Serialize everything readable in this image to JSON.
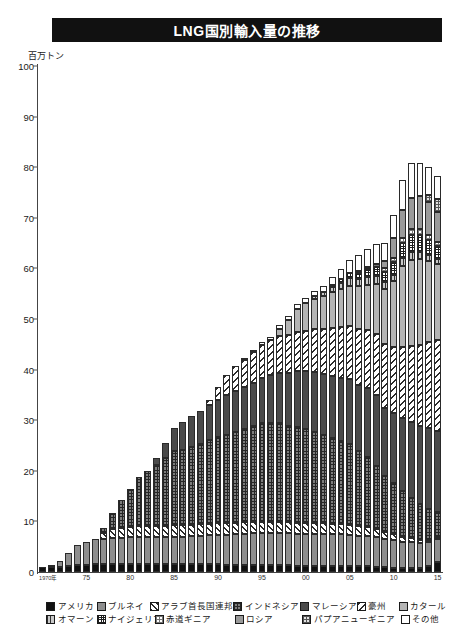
{
  "header": {
    "title": "LNG国別輸入量の推移"
  },
  "axis": {
    "unit_label": "百万トン",
    "y_ticks": [
      "100",
      "90",
      "80",
      "70",
      "60",
      "50",
      "40",
      "30",
      "20",
      "10",
      "0"
    ],
    "x_ticks": [
      "1970年",
      "75",
      "80",
      "85",
      "90",
      "95",
      "00",
      "05",
      "10",
      "15"
    ]
  },
  "legend": {
    "rows": [
      [
        {
          "label": "アメリカ",
          "pattern": "p-america",
          "key": "america"
        },
        {
          "label": "ブルネイ",
          "pattern": "p-brunei",
          "key": "brunei"
        },
        {
          "label": "アラブ首長国連邦",
          "pattern": "p-uae",
          "key": "uae"
        },
        {
          "label": "インドネシア",
          "pattern": "p-indonesia",
          "key": "indonesia"
        },
        {
          "label": "マレーシア",
          "pattern": "p-malaysia",
          "key": "malaysia"
        },
        {
          "label": "豪州",
          "pattern": "p-australia",
          "key": "australia"
        },
        {
          "label": "カタール",
          "pattern": "p-qatar",
          "key": "qatar"
        }
      ],
      [
        {
          "label": "オマーン",
          "pattern": "p-oman",
          "key": "oman"
        },
        {
          "label": "ナイジェリア",
          "pattern": "p-nigeria",
          "key": "nigeria"
        },
        {
          "label": "赤道ギニア",
          "pattern": "p-eqguinea",
          "key": "eqguinea"
        },
        {
          "label": "ロシア",
          "pattern": "p-russia",
          "key": "russia"
        },
        {
          "label": "パプアニューギニア",
          "pattern": "p-png",
          "key": "png"
        },
        {
          "label": "その他",
          "pattern": "p-other",
          "key": "other"
        }
      ]
    ]
  },
  "chart_data": {
    "type": "bar",
    "stacked": true,
    "title": "LNG国別輸入量の推移",
    "xlabel": "",
    "ylabel": "百万トン",
    "ylim": [
      0,
      100
    ],
    "ytick_step": 10,
    "grid": false,
    "legend_position": "bottom",
    "categories": [
      "1970",
      "1971",
      "1972",
      "1973",
      "1974",
      "1975",
      "1976",
      "1977",
      "1978",
      "1979",
      "1980",
      "1981",
      "1982",
      "1983",
      "1984",
      "1985",
      "1986",
      "1987",
      "1988",
      "1989",
      "1990",
      "1991",
      "1992",
      "1993",
      "1994",
      "1995",
      "1996",
      "1997",
      "1998",
      "1999",
      "2000",
      "2001",
      "2002",
      "2003",
      "2004",
      "2005",
      "2006",
      "2007",
      "2008",
      "2009",
      "2010",
      "2011",
      "2012",
      "2013",
      "2014",
      "2015"
    ],
    "series": [
      {
        "name": "アメリカ",
        "pattern": "p-america",
        "values": [
          1.0,
          1.0,
          1.0,
          1.2,
          1.3,
          1.4,
          1.5,
          1.5,
          1.5,
          1.5,
          1.6,
          1.5,
          1.5,
          1.5,
          1.5,
          1.5,
          1.5,
          1.5,
          1.5,
          1.5,
          1.5,
          1.4,
          1.4,
          1.4,
          1.4,
          1.3,
          1.3,
          1.3,
          1.3,
          1.2,
          1.2,
          1.2,
          1.2,
          1.2,
          1.2,
          1.2,
          1.1,
          1.1,
          1.0,
          0.9,
          0.8,
          0.7,
          0.7,
          0.8,
          1.1,
          2.0
        ]
      },
      {
        "name": "ブルネイ",
        "pattern": "p-brunei",
        "values": [
          0.0,
          0.3,
          1.2,
          2.6,
          4.0,
          4.6,
          5.0,
          5.1,
          5.2,
          5.3,
          5.3,
          5.4,
          5.4,
          5.4,
          5.4,
          5.5,
          5.5,
          5.6,
          5.7,
          5.8,
          5.9,
          6.0,
          6.1,
          6.2,
          6.3,
          6.4,
          6.4,
          6.4,
          6.4,
          6.4,
          6.4,
          6.4,
          6.4,
          6.3,
          6.3,
          6.2,
          6.1,
          6.0,
          5.9,
          5.7,
          5.5,
          5.3,
          5.2,
          5.0,
          4.8,
          4.5
        ]
      },
      {
        "name": "アラブ首長国連邦",
        "pattern": "p-uae",
        "values": [
          0,
          0,
          0,
          0,
          0,
          0,
          0,
          1.2,
          1.8,
          1.9,
          2.0,
          2.1,
          2.1,
          2.2,
          2.2,
          2.2,
          2.2,
          2.2,
          2.2,
          2.2,
          2.2,
          2.2,
          2.2,
          2.2,
          2.2,
          2.2,
          2.2,
          2.2,
          2.2,
          2.1,
          2.1,
          2.1,
          2.0,
          2.0,
          1.9,
          1.9,
          1.8,
          1.7,
          1.6,
          1.4,
          1.2,
          1.0,
          0.8,
          0.6,
          0.5,
          0.4
        ]
      },
      {
        "name": "インドネシア",
        "pattern": "p-indonesia",
        "values": [
          0,
          0,
          0,
          0,
          0,
          0,
          0,
          1.0,
          3.2,
          5.5,
          7.5,
          9.8,
          11.0,
          12.0,
          13.5,
          14.8,
          15.0,
          15.5,
          16.0,
          16.5,
          17.0,
          17.5,
          18.0,
          18.5,
          19.0,
          19.5,
          19.5,
          19.5,
          19.0,
          19.0,
          18.5,
          18.0,
          17.5,
          17.0,
          16.5,
          16.0,
          15.0,
          14.0,
          12.5,
          11.0,
          10.0,
          9.0,
          8.0,
          7.0,
          6.0,
          5.0
        ]
      },
      {
        "name": "マレーシア",
        "pattern": "p-malaysia",
        "values": [
          0,
          0,
          0,
          0,
          0,
          0,
          0,
          0,
          0,
          0,
          0,
          0,
          0,
          1.5,
          3.0,
          4.5,
          5.5,
          6.0,
          6.5,
          7.0,
          7.5,
          7.8,
          8.0,
          8.2,
          8.5,
          9.0,
          9.5,
          10.0,
          10.5,
          11.0,
          11.5,
          11.8,
          12.0,
          12.3,
          12.5,
          12.8,
          13.0,
          13.5,
          14.0,
          13.5,
          14.0,
          14.5,
          15.0,
          15.5,
          16.0,
          16.0
        ]
      },
      {
        "name": "豪州",
        "pattern": "p-australia",
        "values": [
          0,
          0,
          0,
          0,
          0,
          0,
          0,
          0,
          0,
          0,
          0,
          0,
          0,
          0,
          0,
          0,
          0,
          0,
          0,
          1.0,
          2.5,
          4.0,
          5.0,
          5.5,
          6.0,
          6.5,
          7.0,
          7.2,
          7.5,
          7.8,
          8.0,
          8.5,
          9.0,
          9.5,
          10.0,
          10.5,
          11.0,
          11.5,
          12.0,
          12.5,
          13.0,
          14.0,
          15.0,
          16.0,
          17.0,
          18.0
        ]
      },
      {
        "name": "カタール",
        "pattern": "p-qatar",
        "values": [
          0,
          0,
          0,
          0,
          0,
          0,
          0,
          0,
          0,
          0,
          0,
          0,
          0,
          0,
          0,
          0,
          0,
          0,
          0,
          0,
          0,
          0,
          0,
          0,
          0,
          0,
          0,
          1.5,
          3.0,
          4.5,
          5.5,
          6.0,
          6.5,
          7.0,
          7.5,
          8.0,
          8.5,
          9.0,
          10.0,
          11.0,
          13.0,
          16.0,
          17.0,
          17.0,
          16.0,
          15.0
        ]
      },
      {
        "name": "オマーン",
        "pattern": "p-oman",
        "values": [
          0,
          0,
          0,
          0,
          0,
          0,
          0,
          0,
          0,
          0,
          0,
          0,
          0,
          0,
          0,
          0,
          0,
          0,
          0,
          0,
          0,
          0,
          0,
          0,
          0,
          0,
          0,
          0,
          0,
          0,
          0,
          0.5,
          0.8,
          1.0,
          1.2,
          1.5,
          1.5,
          1.5,
          1.5,
          1.3,
          1.2,
          1.5,
          1.5,
          1.3,
          1.2,
          1.0
        ]
      },
      {
        "name": "ナイジェリア",
        "pattern": "p-nigeria",
        "values": [
          0,
          0,
          0,
          0,
          0,
          0,
          0,
          0,
          0,
          0,
          0,
          0,
          0,
          0,
          0,
          0,
          0,
          0,
          0,
          0,
          0,
          0,
          0,
          0,
          0,
          0,
          0,
          0,
          0,
          0,
          0,
          0,
          0,
          0.5,
          0.8,
          1.0,
          1.2,
          1.5,
          1.8,
          2.0,
          2.5,
          3.0,
          3.5,
          3.5,
          3.0,
          2.5
        ]
      },
      {
        "name": "赤道ギニア",
        "pattern": "p-eqguinea",
        "values": [
          0,
          0,
          0,
          0,
          0,
          0,
          0,
          0,
          0,
          0,
          0,
          0,
          0,
          0,
          0,
          0,
          0,
          0,
          0,
          0,
          0,
          0,
          0,
          0,
          0,
          0,
          0,
          0,
          0,
          0,
          0,
          0,
          0,
          0,
          0,
          0,
          0.3,
          0.5,
          0.6,
          0.7,
          0.8,
          1.0,
          1.2,
          1.2,
          1.0,
          0.8
        ]
      },
      {
        "name": "ロシア",
        "pattern": "p-russia",
        "values": [
          0,
          0,
          0,
          0,
          0,
          0,
          0,
          0,
          0,
          0,
          0,
          0,
          0,
          0,
          0,
          0,
          0,
          0,
          0,
          0,
          0,
          0,
          0,
          0,
          0,
          0,
          0,
          0,
          0,
          0,
          0,
          0,
          0,
          0,
          0,
          0,
          0,
          0,
          0,
          1.5,
          4.0,
          5.5,
          6.0,
          6.5,
          6.5,
          6.0
        ]
      },
      {
        "name": "パプアニューギニア",
        "pattern": "p-png",
        "values": [
          0,
          0,
          0,
          0,
          0,
          0,
          0,
          0,
          0,
          0,
          0,
          0,
          0,
          0,
          0,
          0,
          0,
          0,
          0,
          0,
          0,
          0,
          0,
          0,
          0,
          0,
          0,
          0,
          0,
          0,
          0,
          0,
          0,
          0,
          0,
          0,
          0,
          0,
          0,
          0,
          0,
          0,
          0,
          0,
          1.5,
          2.5
        ]
      },
      {
        "name": "その他",
        "pattern": "p-other",
        "values": [
          0,
          0,
          0,
          0,
          0,
          0,
          0,
          0,
          0,
          0,
          0,
          0,
          0,
          0,
          0,
          0,
          0,
          0,
          0,
          0,
          0,
          0,
          0,
          0.3,
          0.4,
          0.5,
          0.6,
          0.7,
          0.8,
          0.9,
          1.0,
          1.1,
          1.2,
          1.5,
          2.0,
          2.5,
          3.0,
          3.5,
          4.0,
          3.5,
          4.5,
          6.0,
          7.0,
          6.5,
          5.5,
          4.5
        ]
      }
    ]
  },
  "footnote": ""
}
